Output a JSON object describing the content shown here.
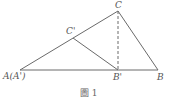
{
  "figure": {
    "caption": "圖 1",
    "line_color": "#6a6a6a",
    "points": {
      "A": {
        "label": "A(A')",
        "x": 20,
        "y": 70
      },
      "B_prime": {
        "label": "B'",
        "x": 118,
        "y": 70
      },
      "B": {
        "label": "B",
        "x": 158,
        "y": 70
      },
      "C": {
        "label": "C",
        "x": 118,
        "y": 11
      },
      "C_prime": {
        "label": "C'",
        "x": 73,
        "y": 38
      }
    },
    "segments": [
      {
        "from": "A",
        "to": "B",
        "style": "solid"
      },
      {
        "from": "A",
        "to": "C",
        "style": "solid"
      },
      {
        "from": "C",
        "to": "B",
        "style": "solid"
      },
      {
        "from": "C_prime",
        "to": "B_prime",
        "style": "solid"
      },
      {
        "from": "C",
        "to": "B_prime",
        "style": "dashed"
      }
    ]
  }
}
